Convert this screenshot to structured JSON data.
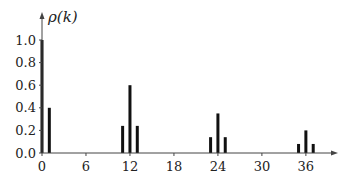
{
  "chart_data": {
    "type": "bar",
    "title": "",
    "ylabel": "ρ(k)",
    "xlabel": "",
    "xlim": [
      0,
      40
    ],
    "ylim": [
      0,
      1.0
    ],
    "x_ticks": [
      0,
      6,
      12,
      18,
      24,
      30,
      36
    ],
    "y_ticks": [
      0.0,
      0.2,
      0.4,
      0.6,
      0.8,
      1.0
    ],
    "y_tick_labels": [
      "0.0",
      "0.2",
      "0.4",
      "0.6",
      "0.8",
      "1.0"
    ],
    "grid": false,
    "legend": null,
    "bar_color": "#111111",
    "x": [
      0,
      1,
      11,
      12,
      13,
      23,
      24,
      25,
      35,
      36,
      37
    ],
    "values": [
      1.0,
      0.4,
      0.24,
      0.6,
      0.24,
      0.14,
      0.35,
      0.14,
      0.08,
      0.2,
      0.08
    ]
  }
}
